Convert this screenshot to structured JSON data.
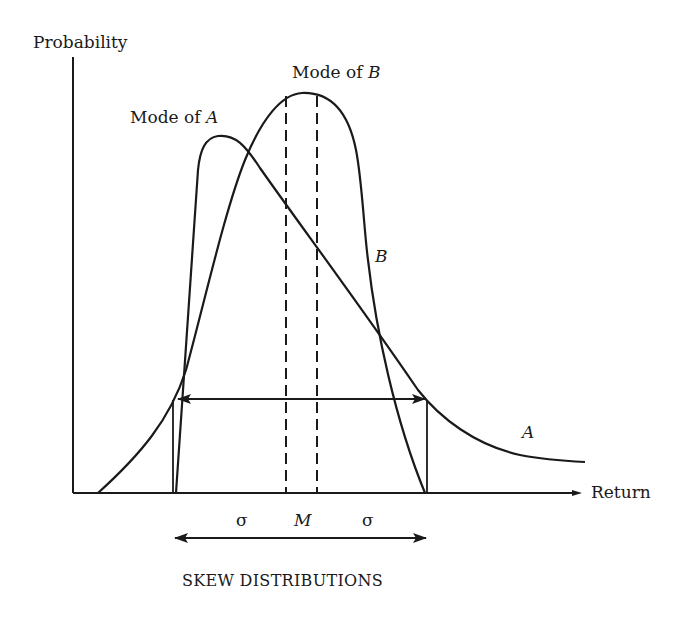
{
  "figure": {
    "title": "SKEW DISTRIBUTIONS",
    "y_axis_label": "Probability",
    "x_axis_label": "Return",
    "annotations": {
      "mode_a_prefix": "Mode of ",
      "mode_a_var": "A",
      "mode_b_prefix": "Mode of ",
      "mode_b_var": "B",
      "curve_b_label": "B",
      "curve_a_label": "A",
      "sigma_left": "σ",
      "mean_label": "M",
      "sigma_right": "σ"
    },
    "colors": {
      "ink": "#1a1a1a",
      "background": "#ffffff"
    }
  },
  "curves": [
    {
      "name": "A",
      "description": "Right-skewed distribution with steep left side and long right tail"
    },
    {
      "name": "B",
      "description": "Left-skewed distribution with steep right side"
    }
  ]
}
